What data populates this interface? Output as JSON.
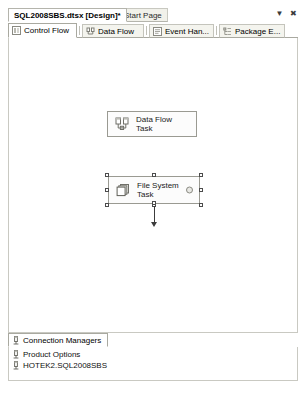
{
  "window": {
    "document_tabs": [
      {
        "label": "SQL2008SBS.dtsx [Design]*",
        "active": true
      },
      {
        "label": "Start Page",
        "active": false
      }
    ],
    "controls": {
      "dropdown_label": "▼",
      "close_label": "✖"
    }
  },
  "designer": {
    "tabs": [
      {
        "label": "Control Flow",
        "icon": "control-flow-icon",
        "active": true
      },
      {
        "label": "Data Flow",
        "icon": "data-flow-icon",
        "active": false
      },
      {
        "label": "Event Han...",
        "icon": "event-handlers-icon",
        "active": false
      },
      {
        "label": "Package E...",
        "icon": "package-explorer-icon",
        "active": false
      }
    ],
    "tasks": [
      {
        "name": "data-flow-task",
        "label": "Data Flow Task",
        "icon": "data-flow-task-icon",
        "selected": false,
        "badge": false
      },
      {
        "name": "file-system-task",
        "label": "File System\nTask",
        "icon": "file-system-task-icon",
        "selected": true,
        "badge": true
      }
    ],
    "connector": {
      "name": "precedence-constraint",
      "direction": "down"
    }
  },
  "connection_managers": {
    "tab_label": "Connection Managers",
    "tab_icon": "connection-manager-icon",
    "items": [
      {
        "label": "Product Options",
        "icon": "connection-manager-icon"
      },
      {
        "label": "HOTEK2.SQL2008SBS",
        "icon": "connection-manager-icon"
      }
    ]
  }
}
